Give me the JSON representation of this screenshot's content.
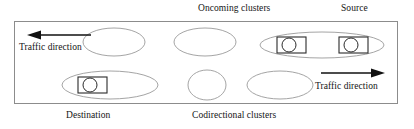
{
  "figure": {
    "width": 414,
    "height": 129,
    "background": "#ffffff",
    "border_color": "#8c8c8c",
    "ellipse_color": "#9a9a9a",
    "car_color": "#2b2b2b",
    "arrow_color": "#111111"
  },
  "labels": {
    "oncoming_clusters": "Oncoming clusters",
    "source": "Source",
    "destination": "Destination",
    "codirectional_clusters": "Codirectional clusters",
    "traffic_direction_left": "Traffic direction",
    "traffic_direction_right": "Traffic direction"
  },
  "icons": {
    "arrow_left": "arrow-left-icon",
    "arrow_right": "arrow-right-icon",
    "car": "car-icon",
    "cluster": "cluster-ellipse-icon"
  },
  "diagram": {
    "type": "vehicular-cluster-schematic",
    "lanes": [
      {
        "name": "upper-lane",
        "direction": "left",
        "direction_label": "Traffic direction",
        "cluster_group_label": "Oncoming clusters",
        "endpoint_label": "Source",
        "clusters": [
          {
            "id": "upper-cluster-1",
            "cx": 114,
            "cy": 42,
            "rx": 31,
            "ry": 14,
            "cars": 0
          },
          {
            "id": "upper-cluster-2",
            "cx": 205,
            "cy": 42,
            "rx": 31,
            "ry": 14,
            "cars": 0
          },
          {
            "id": "upper-cluster-3",
            "cx": 322,
            "cy": 45,
            "rx": 62,
            "ry": 13,
            "cars": 2
          }
        ],
        "cars": [
          {
            "id": "upper-car-1",
            "x": 277,
            "y": 37,
            "w": 29,
            "h": 16,
            "wheel_cx": 289,
            "wheel_cy": 45,
            "wheel_r": 7
          },
          {
            "id": "upper-car-2",
            "x": 339,
            "y": 37,
            "w": 29,
            "h": 16,
            "wheel_cx": 351,
            "wheel_cy": 45,
            "wheel_r": 7
          }
        ]
      },
      {
        "name": "lower-lane",
        "direction": "right",
        "direction_label": "Traffic direction",
        "cluster_group_label": "Codirectional clusters",
        "endpoint_label": "Destination",
        "clusters": [
          {
            "id": "lower-cluster-1",
            "cx": 110,
            "cy": 85,
            "rx": 48,
            "ry": 14,
            "cars": 1
          },
          {
            "id": "lower-cluster-2",
            "cx": 207,
            "cy": 85,
            "rx": 19,
            "ry": 15,
            "cars": 0
          },
          {
            "id": "lower-cluster-3",
            "cx": 280,
            "cy": 85,
            "rx": 33,
            "ry": 14,
            "cars": 0
          }
        ],
        "cars": [
          {
            "id": "lower-car-1",
            "x": 78,
            "y": 77,
            "w": 29,
            "h": 16,
            "wheel_cx": 90,
            "wheel_cy": 85,
            "wheel_r": 7
          }
        ]
      }
    ],
    "arrows": [
      {
        "id": "arrow-left",
        "direction": "left",
        "x1": 91,
        "y1": 35,
        "x2": 31,
        "y2": 35
      },
      {
        "id": "arrow-right",
        "direction": "right",
        "x1": 321,
        "y1": 73,
        "x2": 382,
        "y2": 73
      }
    ]
  }
}
